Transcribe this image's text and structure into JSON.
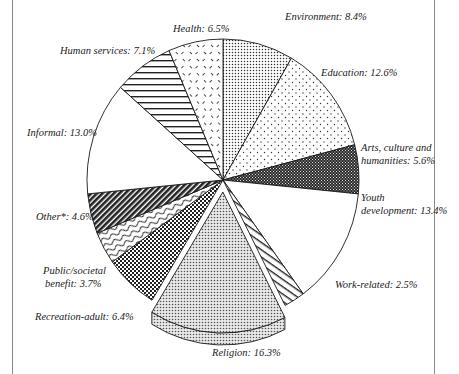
{
  "chart_data": {
    "type": "pie",
    "title": "",
    "start_angle_deg": 0,
    "direction": "clockwise",
    "exploded": [
      "Religion"
    ],
    "unit": "%",
    "slices": [
      {
        "label": "Environment",
        "value": 8.4,
        "display": "Environment: 8.4%",
        "pattern": "dense-dots"
      },
      {
        "label": "Education",
        "value": 12.6,
        "display": "Education: 12.6%",
        "pattern": "sparse-dots"
      },
      {
        "label": "Arts, culture and humanities",
        "value": 5.6,
        "display_lines": [
          "Arts, culture and",
          "humanities: 5.6%"
        ],
        "pattern": "dark-check"
      },
      {
        "label": "Youth development",
        "value": 13.4,
        "display_lines": [
          "Youth",
          "development: 13.4%"
        ],
        "pattern": "white"
      },
      {
        "label": "Work-related",
        "value": 2.5,
        "display": "Work-related: 2.5%",
        "pattern": "diag-lines"
      },
      {
        "label": "Religion",
        "value": 16.3,
        "display": "Religion: 16.3%",
        "pattern": "fine-dots"
      },
      {
        "label": "Recreation-adult",
        "value": 6.4,
        "display": "Recreation-adult: 6.4%",
        "pattern": "crosshatch"
      },
      {
        "label": "Public/societal benefit",
        "value": 3.7,
        "display_lines": [
          "Public/societal",
          "benefit: 3.7%"
        ],
        "pattern": "wave"
      },
      {
        "label": "Other*",
        "value": 4.6,
        "display": "Other*: 4.6%",
        "pattern": "dark-diag"
      },
      {
        "label": "Informal",
        "value": 13.0,
        "display": "Informal: 13.0%",
        "pattern": "white"
      },
      {
        "label": "Human services",
        "value": 7.1,
        "display": "Human services: 7.1%",
        "pattern": "horiz-lines"
      },
      {
        "label": "Health",
        "value": 6.5,
        "display": "Health: 6.5%",
        "pattern": "dashes"
      }
    ],
    "legend": "none (labels placed outside slices)"
  },
  "labels": {
    "environment": "Environment: 8.4%",
    "education": "Education: 12.6%",
    "arts_1": "Arts, culture and",
    "arts_2": "humanities: 5.6%",
    "youth_1": "Youth",
    "youth_2": "development: 13.4%",
    "work": "Work-related: 2.5%",
    "religion": "Religion: 16.3%",
    "recreation": "Recreation-adult: 6.4%",
    "public_1": "Public/societal",
    "public_2": "benefit: 3.7%",
    "other": "Other*: 4.6%",
    "informal": "Informal: 13.0%",
    "human": "Human services: 7.1%",
    "health": "Health: 6.5%"
  },
  "colors": {
    "ink": "#1a1a1a",
    "frame": "#8a8a8a",
    "background": "#ffffff"
  }
}
